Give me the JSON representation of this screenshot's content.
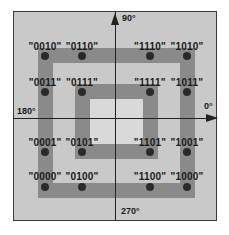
{
  "diagram": {
    "type": "constellation-diagram",
    "axis_labels": {
      "top": "90°",
      "left": "180°",
      "right": "0°",
      "bottom": "270°"
    },
    "points": [
      {
        "label": "\"0010\"",
        "col": 0,
        "row": 0
      },
      {
        "label": "\"0110\"",
        "col": 1,
        "row": 0
      },
      {
        "label": "\"1110\"",
        "col": 2,
        "row": 0
      },
      {
        "label": "\"1010\"",
        "col": 3,
        "row": 0
      },
      {
        "label": "\"0011\"",
        "col": 0,
        "row": 1
      },
      {
        "label": "\"0111\"",
        "col": 1,
        "row": 1
      },
      {
        "label": "\"1111\"",
        "col": 2,
        "row": 1
      },
      {
        "label": "\"1011\"",
        "col": 3,
        "row": 1
      },
      {
        "label": "\"0001\"",
        "col": 0,
        "row": 2
      },
      {
        "label": "\"0101\"",
        "col": 1,
        "row": 2
      },
      {
        "label": "\"1101\"",
        "col": 2,
        "row": 2
      },
      {
        "label": "\"1001\"",
        "col": 3,
        "row": 2
      },
      {
        "label": "\"0000\"",
        "col": 0,
        "row": 3
      },
      {
        "label": "\"0100\"",
        "col": 1,
        "row": 3
      },
      {
        "label": "\"1100\"",
        "col": 2,
        "row": 3
      },
      {
        "label": "\"1000\"",
        "col": 3,
        "row": 3
      }
    ],
    "colors": {
      "background": "#c9c9c9",
      "ring": "#8a8a8a",
      "dot": "#2a2a2a",
      "axis": "#222222"
    }
  }
}
